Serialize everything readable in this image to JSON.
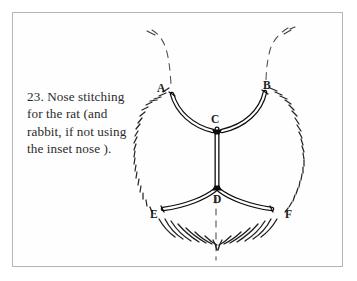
{
  "page": {
    "background_color": "#ffffff",
    "frame_border_color": "#b4b4b4"
  },
  "caption": {
    "text": "23. Nose stitching for the rat (and rabbit, if not using the inset nose )."
  },
  "figure": {
    "name": "rat-nose-stitching-diagram",
    "ink_color": "#111111",
    "guide_color": "#555555",
    "labels": [
      {
        "id": "A",
        "text": "A"
      },
      {
        "id": "B",
        "text": "B"
      },
      {
        "id": "C",
        "text": "C"
      },
      {
        "id": "D",
        "text": "D"
      },
      {
        "id": "E",
        "text": "E"
      },
      {
        "id": "F",
        "text": "F"
      }
    ]
  }
}
